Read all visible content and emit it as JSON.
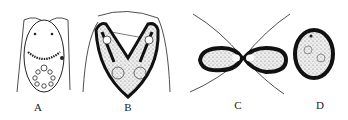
{
  "figure": {
    "panels": [
      {
        "id": "A",
        "label": "A",
        "description": "cell with two flagella, two dots at top, beaded arc and ring of granules"
      },
      {
        "id": "B",
        "label": "B",
        "description": "V-shaped dividing form with two nuclei, dark stippled body"
      },
      {
        "id": "C",
        "label": "C",
        "description": "two oval cells separating with crossing flagella"
      },
      {
        "id": "D",
        "label": "D",
        "description": "single dark oval cyst with stippled interior"
      }
    ],
    "colors": {
      "ink": "#1a1a1a",
      "stipple": "#d8d8d8",
      "background": "#ffffff"
    }
  }
}
